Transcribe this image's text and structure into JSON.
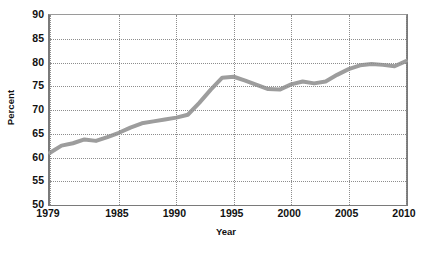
{
  "chart_data": {
    "type": "line",
    "title": "",
    "xlabel": "Year",
    "ylabel": "Percent",
    "xlim": [
      1979,
      2010
    ],
    "ylim": [
      50,
      90
    ],
    "ytick_labels": [
      "90",
      "85",
      "80",
      "75",
      "70",
      "65",
      "60",
      "55",
      "50"
    ],
    "ytick_values": [
      90,
      85,
      80,
      75,
      70,
      65,
      60,
      55,
      50
    ],
    "xtick_labels": [
      "1979",
      "1985",
      "1990",
      "1995",
      "2000",
      "2005",
      "2010"
    ],
    "xtick_values": [
      1979,
      1985,
      1990,
      1995,
      2000,
      2005,
      2010
    ],
    "grid": true,
    "legend": "none",
    "line_color": "#9d9d9d",
    "line_width": 4,
    "x": [
      1979,
      1980,
      1981,
      1982,
      1983,
      1984,
      1985,
      1986,
      1987,
      1988,
      1989,
      1990,
      1991,
      1992,
      1993,
      1994,
      1995,
      1996,
      1997,
      1998,
      1999,
      2000,
      2001,
      2002,
      2003,
      2004,
      2005,
      2006,
      2007,
      2008,
      2009,
      2010
    ],
    "values": [
      61.0,
      62.5,
      63.0,
      63.8,
      63.5,
      64.3,
      65.2,
      66.3,
      67.2,
      67.6,
      68.0,
      68.4,
      69.0,
      71.5,
      74.3,
      76.8,
      77.0,
      76.2,
      75.3,
      74.4,
      74.3,
      75.4,
      76.0,
      75.6,
      76.0,
      77.4,
      78.6,
      79.4,
      79.7,
      79.5,
      79.2,
      80.3
    ],
    "series": [
      {
        "name": "Percent",
        "values": [
          61.0,
          62.5,
          63.0,
          63.8,
          63.5,
          64.3,
          65.2,
          66.3,
          67.2,
          67.6,
          68.0,
          68.4,
          69.0,
          71.5,
          74.3,
          76.8,
          77.0,
          76.2,
          75.3,
          74.4,
          74.3,
          75.4,
          76.0,
          75.6,
          76.0,
          77.4,
          78.6,
          79.4,
          79.7,
          79.5,
          79.2,
          80.3
        ]
      }
    ]
  }
}
